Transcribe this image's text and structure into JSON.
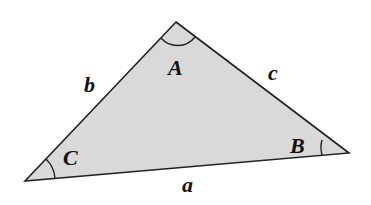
{
  "diagram": {
    "type": "triangle",
    "fill_color": "#d9d9d9",
    "stroke_color": "#222222",
    "vertices": {
      "A": {
        "label": "A",
        "x": 176,
        "y": 22
      },
      "B": {
        "label": "B",
        "x": 349,
        "y": 153
      },
      "C": {
        "label": "C",
        "x": 25,
        "y": 181
      }
    },
    "sides": {
      "a": {
        "label": "a",
        "opposite": "A"
      },
      "b": {
        "label": "b",
        "opposite": "B"
      },
      "c": {
        "label": "c",
        "opposite": "C"
      }
    }
  }
}
